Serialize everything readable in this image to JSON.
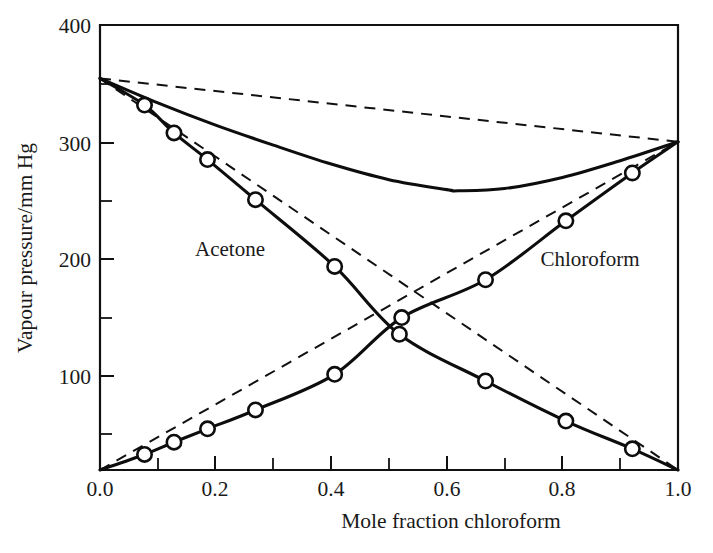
{
  "chart_data": {
    "type": "line",
    "title": "",
    "subtitle": "",
    "xlabel": "Mole fraction chloroform",
    "ylabel": "Vapour pressure/mm Hg",
    "xlim": [
      0.0,
      1.0
    ],
    "ylim": [
      0,
      400
    ],
    "grid": false,
    "legend_position": "inline-annotation",
    "x_ticks_major": [
      "0.0",
      "0.2",
      "0.4",
      "0.6",
      "0.8",
      "1.0"
    ],
    "x_ticks_major_values": [
      0.0,
      0.2,
      0.4,
      0.6,
      0.8,
      1.0
    ],
    "x_ticks_minor_values": [
      0.1,
      0.3,
      0.5,
      0.7,
      0.9
    ],
    "y_ticks_major": [
      "100",
      "200",
      "300",
      "400"
    ],
    "y_ticks_major_values": [
      0,
      100,
      200,
      300,
      400
    ],
    "y_ticks_minor_values": [
      50,
      150,
      250,
      350
    ],
    "annotations": [
      {
        "text": "Acetone",
        "x": 0.255,
        "y": 215
      },
      {
        "text": "Chloroform",
        "x": 0.735,
        "y": 210
      }
    ],
    "series": [
      {
        "name": "Acetone partial pressure (experimental)",
        "style": "solid-with-markers",
        "x": [
          0.0,
          0.077,
          0.128,
          0.186,
          0.269,
          0.406,
          0.518,
          0.667,
          0.806,
          0.921,
          1.0
        ],
        "y": [
          352,
          328,
          303,
          279,
          243,
          183,
          122,
          80,
          44,
          19,
          0
        ]
      },
      {
        "name": "Acetone Raoult ideal line",
        "style": "dashed",
        "x": [
          0.0,
          1.0
        ],
        "y": [
          352,
          0
        ]
      },
      {
        "name": "Chloroform partial pressure (experimental)",
        "style": "solid-with-markers",
        "x": [
          0.0,
          0.077,
          0.128,
          0.186,
          0.269,
          0.406,
          0.522,
          0.667,
          0.806,
          0.921,
          1.0
        ],
        "y": [
          0,
          14,
          25,
          37,
          54,
          86,
          137,
          171,
          224,
          267,
          295
        ]
      },
      {
        "name": "Chloroform Raoult ideal line",
        "style": "dashed",
        "x": [
          0.0,
          1.0
        ],
        "y": [
          0,
          295
        ]
      },
      {
        "name": "Total vapour pressure",
        "style": "solid",
        "x": [
          0.0,
          0.1,
          0.2,
          0.3,
          0.4,
          0.5,
          0.6,
          0.62,
          0.7,
          0.8,
          0.9,
          1.0
        ],
        "y": [
          352,
          330,
          310,
          292,
          275,
          261,
          252,
          251,
          253,
          263,
          278,
          295
        ]
      },
      {
        "name": "Ideal total pressure line",
        "style": "dashed",
        "x": [
          0.0,
          1.0
        ],
        "y": [
          352,
          295
        ]
      }
    ]
  },
  "axes": {
    "y_label": "Vapour pressure/mm Hg",
    "x_label": "Mole fraction chloroform",
    "y_tick_400": "400",
    "y_tick_300": "300",
    "y_tick_200": "200",
    "y_tick_100": "100",
    "x_tick_00": "0.0",
    "x_tick_02": "0.2",
    "x_tick_04": "0.4",
    "x_tick_06": "0.6",
    "x_tick_08": "0.8",
    "x_tick_10": "1.0"
  },
  "labels": {
    "acetone": "Acetone",
    "chloroform": "Chloroform"
  },
  "colors": {
    "ink": "#0d0d0d",
    "background": "#ffffff"
  }
}
